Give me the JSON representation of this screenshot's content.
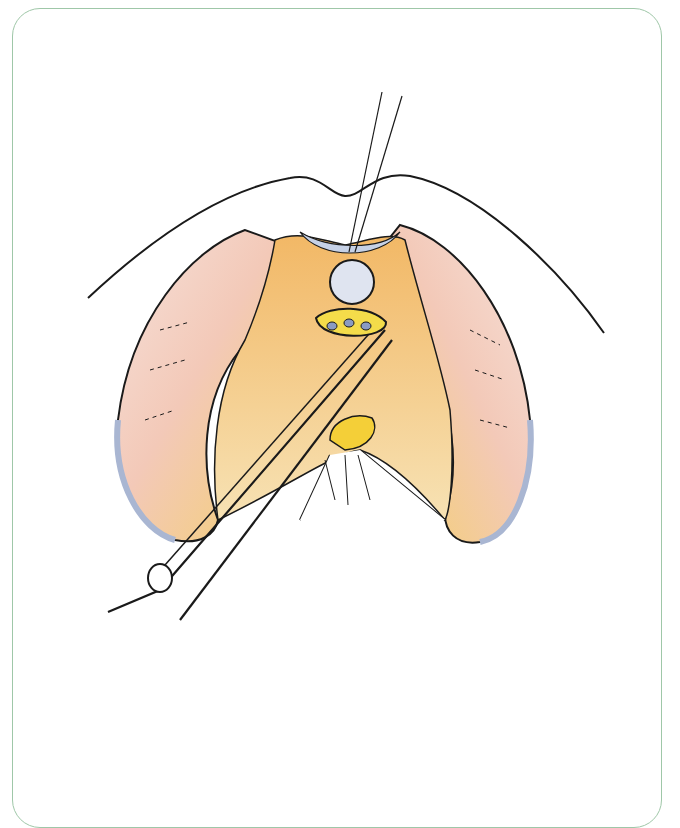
{
  "figure": {
    "kind": "surgical illustration",
    "caption": "",
    "colors": {
      "frame_border": "#9fc7a8",
      "outline": "#1a1a1a",
      "tissue_orange": "#f2b866",
      "tissue_yellow": "#f6d24a",
      "muscle_pink": "#e9a59a",
      "membrane_blue": "#b9c6de",
      "background": "#ffffff"
    }
  }
}
